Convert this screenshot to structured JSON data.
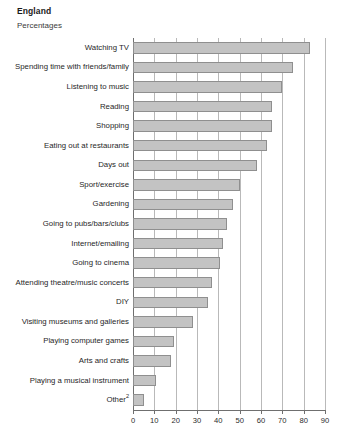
{
  "header": {
    "title": "England",
    "subtitle": "Percentages"
  },
  "chart_data": {
    "type": "bar",
    "orientation": "horizontal",
    "title": "England",
    "subtitle": "Percentages",
    "xlabel": "",
    "ylabel": "",
    "xlim": [
      0,
      90
    ],
    "xticks": [
      0,
      10,
      20,
      30,
      40,
      50,
      60,
      70,
      80,
      90
    ],
    "grid": true,
    "legend": false,
    "bar_color": "#c3c3c3",
    "bar_border_color": "#8f8f8f",
    "categories": [
      "Watching TV",
      "Spending time with friends/family",
      "Listening to music",
      "Reading",
      "Shopping",
      "Eating out at restaurants",
      "Days out",
      "Sport/exercise",
      "Gardening",
      "Going to pubs/bars/clubs",
      "Internet/emailing",
      "Going to cinema",
      "Attending theatre/music concerts",
      "DIY",
      "Visiting museums and galleries",
      "Playing computer games",
      "Arts and crafts",
      "Playing a musical instrument",
      "Other"
    ],
    "category_footnotes": {
      "Other": "2"
    },
    "values": [
      83,
      75,
      70,
      65,
      65,
      63,
      58,
      50,
      47,
      44,
      42,
      41,
      37,
      35,
      28,
      19,
      18,
      11,
      5
    ],
    "series": [
      {
        "name": "Percentage",
        "values": [
          83,
          75,
          70,
          65,
          65,
          63,
          58,
          50,
          47,
          44,
          42,
          41,
          37,
          35,
          28,
          19,
          18,
          11,
          5
        ]
      }
    ]
  }
}
